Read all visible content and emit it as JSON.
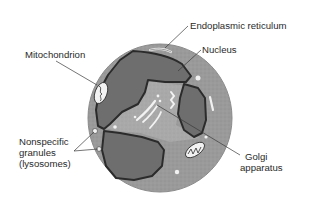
{
  "diagram": {
    "type": "labeled-cell-diagram",
    "colors": {
      "cytoplasm": "#9a9a9a",
      "nucleus": "#6e6e6e",
      "clear_region": "#a9a9a9",
      "membrane_outline": "#2b2b2b",
      "organelle_fill": "#f2f2f2",
      "label_text": "#2a2a2a",
      "leader_line": "#3a3a3a",
      "background": "#ffffff"
    },
    "labels": {
      "endoplasmic_reticulum": "Endoplasmic reticulum",
      "nucleus": "Nucleus",
      "mitochondrion": "Mitochondrion",
      "granules_line1": "Nonspecific",
      "granules_line2": "granules",
      "granules_line3": "(lysosomes)",
      "golgi_line1": "Golgi",
      "golgi_line2": "apparatus"
    }
  }
}
